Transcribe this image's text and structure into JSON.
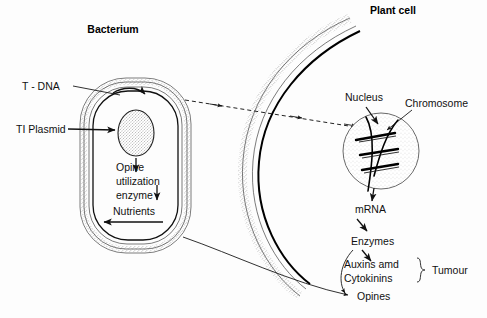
{
  "figure": {
    "title_bacterium": "Bacterium",
    "title_plant_cell": "Plant cell",
    "background_color": "#fdfdfd",
    "ink_color": "#111111"
  },
  "bacterium": {
    "labels": {
      "t_dna": "T - DNA",
      "ti_plasmid": "TI Plasmid",
      "opine_line1": "Opine",
      "opine_line2": "utilization",
      "opine_line3": "enzyme",
      "nutrients": "Nutrients"
    }
  },
  "plant_cell": {
    "labels": {
      "nucleus": "Nucleus",
      "chromosome": "Chromosome",
      "mrna": "mRNA",
      "enzymes": "Enzymes",
      "auxins": "Auxins amd",
      "cytokinins": "Cytokinins",
      "tumour": "Tumour",
      "opines": "Opines"
    }
  }
}
